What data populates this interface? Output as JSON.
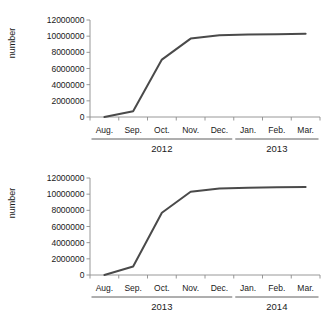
{
  "figure": {
    "background_color": "#ffffff",
    "line_color": "#4a4a4a",
    "axis_color": "#8c8c8c"
  },
  "chart_data": [
    {
      "type": "line",
      "title": "",
      "xlabel": "",
      "ylabel": "number",
      "categories": [
        "Aug.",
        "Sep.",
        "Oct.",
        "Nov.",
        "Dec.",
        "Jan.",
        "Feb.",
        "Mar."
      ],
      "group_labels": [
        "2012",
        "2013"
      ],
      "group_spans": [
        [
          "Aug.",
          "Dec."
        ],
        [
          "Jan.",
          "Mar."
        ]
      ],
      "values": [
        0,
        700000,
        7100000,
        9700000,
        10100000,
        10200000,
        10250000,
        10300000
      ],
      "ylim": [
        0,
        12000000
      ],
      "ytick_labels": [
        "0",
        "2000000",
        "4000000",
        "6000000",
        "8000000",
        "10000000",
        "12000000"
      ],
      "ytick_values": [
        0,
        2000000,
        4000000,
        6000000,
        8000000,
        10000000,
        12000000
      ],
      "grid": false,
      "legend": "none"
    },
    {
      "type": "line",
      "title": "",
      "xlabel": "",
      "ylabel": "number",
      "categories": [
        "Aug.",
        "Sep.",
        "Oct.",
        "Nov.",
        "Dec.",
        "Jan.",
        "Feb.",
        "Mar."
      ],
      "group_labels": [
        "2013",
        "2014"
      ],
      "group_spans": [
        [
          "Aug.",
          "Dec."
        ],
        [
          "Jan.",
          "Mar."
        ]
      ],
      "values": [
        0,
        1050000,
        7700000,
        10300000,
        10700000,
        10800000,
        10850000,
        10900000
      ],
      "ylim": [
        0,
        12000000
      ],
      "ytick_labels": [
        "0",
        "2000000",
        "4000000",
        "6000000",
        "8000000",
        "10000000",
        "12000000"
      ],
      "ytick_values": [
        0,
        2000000,
        4000000,
        6000000,
        8000000,
        10000000,
        12000000
      ],
      "grid": false,
      "legend": "none"
    }
  ]
}
